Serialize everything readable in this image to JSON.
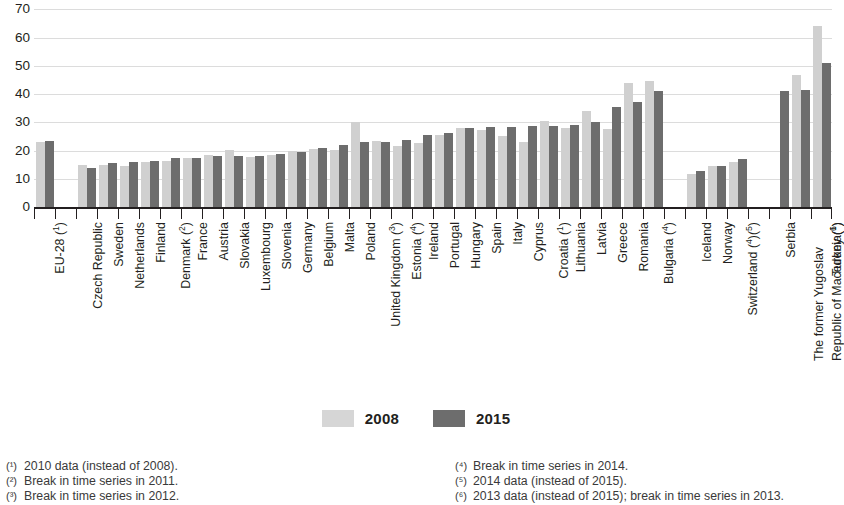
{
  "chart_data": {
    "type": "bar",
    "title": "",
    "xlabel": "",
    "ylabel": "",
    "ylim": [
      0,
      70
    ],
    "yticks": [
      0,
      10,
      20,
      30,
      40,
      50,
      60,
      70
    ],
    "grid": true,
    "legend_position": "bottom-center",
    "categories": [
      "EU-28 (¹)",
      "",
      "Czech Republic",
      "Sweden",
      "Netherlands",
      "Finland",
      "Denmark (²)",
      "France",
      "Austria",
      "Slovakia",
      "Luxembourg",
      "Slovenia",
      "Germany",
      "Belgium",
      "Malta",
      "Poland",
      "United Kingdom (³)",
      "Estonia (⁴)",
      "Ireland",
      "Portugal",
      "Hungary",
      "Spain",
      "Italy",
      "Cyprus",
      "Croatia (¹)",
      "Lithuania",
      "Latvia",
      "Greece",
      "Romania",
      "Bulgaria (⁴)",
      "",
      "Iceland",
      "Norway",
      "Switzerland (⁴)(⁵)",
      "",
      "Serbia",
      "The former Yugoslav Republic of Macedonia (¹)",
      "Turkey (⁶)"
    ],
    "series": [
      {
        "name": "2008",
        "color": "#d0d0d0",
        "values": [
          23.5,
          null,
          15.3,
          15.4,
          15.0,
          16.3,
          16.8,
          17.6,
          18.8,
          20.6,
          17.9,
          18.6,
          20.1,
          20.8,
          20.6,
          30.3,
          23.7,
          22.0,
          23.1,
          26.0,
          28.2,
          27.7,
          25.4,
          23.3,
          30.9,
          28.3,
          34.2,
          28.1,
          44.2,
          44.8,
          null,
          11.9,
          15.0,
          16.2,
          null,
          null,
          47.0,
          64.4
        ]
      },
      {
        "name": "2015",
        "color": "#6d6d6d",
        "values": [
          23.7,
          null,
          14.0,
          16.0,
          16.4,
          16.8,
          17.7,
          17.7,
          18.3,
          18.4,
          18.5,
          19.2,
          20.0,
          21.1,
          22.4,
          23.4,
          23.5,
          24.2,
          26.0,
          26.6,
          28.2,
          28.6,
          28.7,
          28.9,
          29.1,
          29.3,
          30.6,
          35.7,
          37.4,
          41.3,
          null,
          13.0,
          15.0,
          17.2,
          null,
          41.3,
          41.7,
          51.5
        ]
      }
    ]
  },
  "legend": {
    "items": [
      {
        "label": "2008",
        "swatch": "light-gray-swatch",
        "color": "#d6d6d6"
      },
      {
        "label": "2015",
        "swatch": "dark-gray-swatch",
        "color": "#6d6d6d"
      }
    ]
  },
  "footnotes": {
    "left": [
      {
        "marker": "(¹)",
        "text": "2010 data (instead of 2008)."
      },
      {
        "marker": "(²)",
        "text": "Break in time series in 2011."
      },
      {
        "marker": "(³)",
        "text": "Break in time series in 2012."
      }
    ],
    "right": [
      {
        "marker": "(⁴)",
        "text": "Break in time series in 2014."
      },
      {
        "marker": "(⁵)",
        "text": "2014 data (instead of 2015)."
      },
      {
        "marker": "(⁶)",
        "text": "2013 data (instead of 2015); break in time series in 2013."
      }
    ]
  }
}
